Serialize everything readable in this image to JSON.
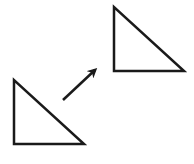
{
  "diagram": {
    "stroke_color": "#1a1a1a",
    "background": "#ffffff",
    "shapes": {
      "original_triangle": {
        "points": [
          [
            14,
            80
          ],
          [
            14,
            144
          ],
          [
            84,
            144
          ]
        ]
      },
      "translated_triangle": {
        "points": [
          [
            114,
            7
          ],
          [
            114,
            71
          ],
          [
            184,
            71
          ]
        ]
      },
      "arrow": {
        "from": [
          63,
          100
        ],
        "to": [
          98,
          67
        ]
      }
    }
  }
}
